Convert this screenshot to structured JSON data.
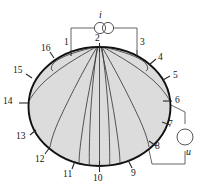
{
  "figure": {
    "shape": "ellipse",
    "fill_color": "#dcdcdc",
    "boundary_color": "#111111",
    "streamline_color": "#3a3a3a",
    "wire_color": "#555555",
    "label_color": "#141414",
    "background": "#ffffff"
  },
  "sources": {
    "current": {
      "symbol_name": "current-source-double-circle",
      "label": "i",
      "connected_electrodes": [
        "1",
        "3"
      ]
    },
    "voltage": {
      "symbol_name": "voltmeter-circle",
      "label": "u",
      "connected_electrodes": [
        "6",
        "8"
      ]
    }
  },
  "electrodes": [
    {
      "id": "1",
      "label": "1",
      "x": 77,
      "y": 43
    },
    {
      "id": "2",
      "label": "2",
      "x": 99,
      "y": 43
    },
    {
      "id": "3",
      "label": "3",
      "x": 131,
      "y": 43
    },
    {
      "id": "4",
      "label": "4",
      "x": 156,
      "y": 61
    },
    {
      "id": "5",
      "label": "5",
      "x": 171,
      "y": 80
    },
    {
      "id": "6",
      "label": "6",
      "x": 176,
      "y": 102
    },
    {
      "id": "7",
      "label": "7",
      "x": 170,
      "y": 127
    },
    {
      "id": "8",
      "label": "8",
      "x": 157,
      "y": 145
    },
    {
      "id": "9",
      "label": "9",
      "x": 128,
      "y": 172
    },
    {
      "id": "10",
      "label": "10",
      "x": 96,
      "y": 177
    },
    {
      "id": "11",
      "label": "11",
      "x": 70,
      "y": 172
    },
    {
      "id": "12",
      "label": "12",
      "x": 42,
      "y": 157
    },
    {
      "id": "13",
      "label": "13",
      "x": 22,
      "y": 137
    },
    {
      "id": "14",
      "label": "14",
      "x": 8,
      "y": 102
    },
    {
      "id": "15",
      "label": "15",
      "x": 18,
      "y": 72
    },
    {
      "id": "16",
      "label": "16",
      "x": 44,
      "y": 53
    }
  ],
  "streamlines": {
    "count": 10,
    "origin": "electrode-2-top-center",
    "terminations": [
      "16",
      "15",
      "14",
      "13",
      "12",
      "11",
      "10",
      "9",
      "8",
      "7",
      "6",
      "5",
      "4"
    ]
  }
}
